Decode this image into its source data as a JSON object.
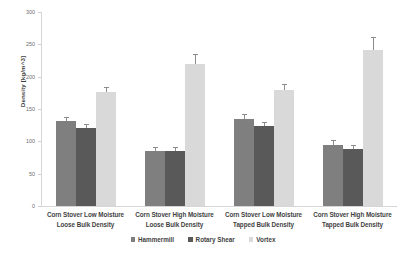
{
  "chart_data": {
    "type": "bar",
    "title": "",
    "xlabel": "",
    "ylabel": "Density [kg/m^3]",
    "ylim": [
      0,
      300
    ],
    "yticks": [
      0,
      50,
      100,
      150,
      200,
      250,
      300
    ],
    "ytick_labels": [
      "0",
      "50",
      "100",
      "150",
      "200",
      "250",
      "300"
    ],
    "grid": false,
    "legend_position": "bottom",
    "categories": [
      "Corn Stover Low Moisture Loose Bulk Density",
      "Corn Stover High Moisture Loose Bulk Density",
      "Corn Stover Low Moisture Tapped Bulk Density",
      "Corn Stover High Moisture Tapped Bulk Density"
    ],
    "category_lines": [
      [
        "Corn Stover Low Moisture",
        "Loose Bulk Density"
      ],
      [
        "Corn Stover High Moisture",
        "Loose Bulk Density"
      ],
      [
        "Corn Stover Low Moisture",
        "Tapped Bulk Density"
      ],
      [
        "Corn Stover High Moisture",
        "Tapped Bulk Density"
      ]
    ],
    "series": [
      {
        "name": "Hammermill",
        "color": "#7f7f7f",
        "values": [
          131,
          85,
          135,
          95
        ],
        "errors": [
          5,
          5,
          6,
          6
        ]
      },
      {
        "name": "Rotary Shear",
        "color": "#595959",
        "values": [
          120,
          85,
          124,
          88
        ],
        "errors": [
          5,
          4,
          5,
          5
        ]
      },
      {
        "name": "Vortex",
        "color": "#d9d9d9",
        "values": [
          176,
          220,
          180,
          242
        ],
        "errors": [
          7,
          14,
          7,
          18
        ]
      }
    ]
  },
  "legend": {
    "items": [
      {
        "label": "Hammermill",
        "color": "#7f7f7f"
      },
      {
        "label": "Rotary Shear",
        "color": "#595959"
      },
      {
        "label": "Vortex",
        "color": "#d9d9d9"
      }
    ]
  }
}
